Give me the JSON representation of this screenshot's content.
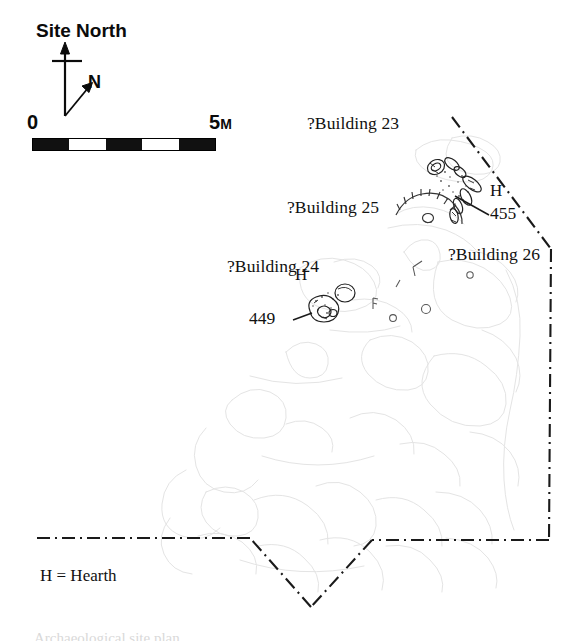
{
  "figure": {
    "kind": "archaeological-site-plan",
    "background_color": "#ffffff",
    "ink_color": "#111111",
    "faint_plan_color": "#e2e2e2"
  },
  "north_indicator": {
    "site_north_label": "Site North",
    "true_north_label": "N"
  },
  "scale_bar": {
    "start_label": "0",
    "end_value": "5",
    "end_unit": "M",
    "segments": [
      "dark",
      "light",
      "dark",
      "light",
      "dark"
    ],
    "total_meters": 5
  },
  "building_labels": [
    {
      "id": "building-23",
      "text": "?Building 23"
    },
    {
      "id": "building-25",
      "text": "?Building 25"
    },
    {
      "id": "building-24",
      "text": "?Building 24"
    },
    {
      "id": "building-26",
      "text": "?Building 26"
    }
  ],
  "hearth_markers": [
    {
      "id": "hearth-455",
      "text": "H"
    },
    {
      "id": "hearth-449",
      "text": "H"
    }
  ],
  "feature_labels": [
    {
      "id": "feature-455",
      "text": "455"
    },
    {
      "id": "feature-449",
      "text": "449"
    }
  ],
  "legend": {
    "hearth_key": "H = Hearth"
  },
  "caption": {
    "sliver_text": "Archaeological site plan"
  }
}
